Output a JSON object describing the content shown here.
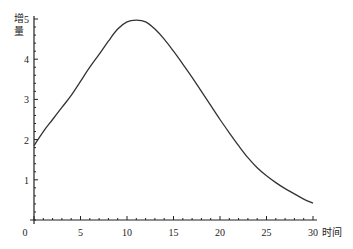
{
  "chart_data": {
    "type": "line",
    "title": "",
    "xlabel": "时间",
    "ylabel": "增量",
    "xlim": [
      0,
      30
    ],
    "ylim": [
      0,
      5
    ],
    "grid": false,
    "legend": null,
    "x_ticks": [
      0,
      5,
      10,
      15,
      20,
      25,
      30
    ],
    "x_tick_labels": [
      "0",
      "5",
      "10",
      "15",
      "20",
      "25",
      "30"
    ],
    "y_ticks": [
      1,
      2,
      3,
      4,
      5
    ],
    "y_tick_labels": [
      "1",
      "2",
      "3",
      "4",
      "5"
    ],
    "x_minor_step": 1,
    "y_minor_step": 0.2,
    "series": [
      {
        "name": "增量",
        "x": [
          0,
          1,
          2,
          3,
          4,
          5,
          6,
          7,
          8,
          9,
          10,
          11,
          12,
          13,
          14,
          15,
          16,
          17,
          18,
          19,
          20,
          21,
          22,
          23,
          24,
          25,
          26,
          27,
          28,
          29,
          30
        ],
        "values": [
          1.85,
          2.2,
          2.5,
          2.8,
          3.1,
          3.45,
          3.8,
          4.12,
          4.45,
          4.75,
          4.93,
          4.97,
          4.93,
          4.75,
          4.5,
          4.2,
          3.88,
          3.55,
          3.2,
          2.85,
          2.5,
          2.17,
          1.85,
          1.55,
          1.3,
          1.1,
          0.93,
          0.78,
          0.65,
          0.52,
          0.42
        ]
      }
    ]
  }
}
